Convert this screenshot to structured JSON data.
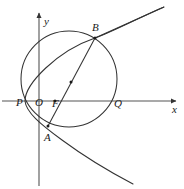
{
  "figure": {
    "title": "",
    "type": "geometry-diagram",
    "background": "#ffffff",
    "stroke_color": "#333333",
    "label_color": "#1a1a1a",
    "width": 184,
    "height": 189
  },
  "axes": {
    "x_label": "x",
    "y_label": "y",
    "origin_label": "O",
    "x_axis": {
      "y": 101,
      "x_start": 2,
      "x_end": 176,
      "arrow": true
    },
    "y_axis": {
      "x": 39,
      "y_start": 13,
      "y_end": 186,
      "arrow": true
    }
  },
  "points": [
    {
      "name": "P",
      "label": "P",
      "x": 25,
      "y": 101,
      "label_dx": -9,
      "label_dy": 2,
      "dot": false
    },
    {
      "name": "O",
      "label": "O",
      "x": 39,
      "y": 101,
      "label_dx": -4,
      "label_dy": 2,
      "dot": false
    },
    {
      "name": "F",
      "label": "F",
      "x": 55,
      "y": 101,
      "label_dx": -3,
      "label_dy": 3,
      "dot": true
    },
    {
      "name": "Q",
      "label": "Q",
      "x": 117,
      "y": 101,
      "label_dx": -3,
      "label_dy": 3,
      "dot": false
    },
    {
      "name": "B",
      "label": "B",
      "x": 95,
      "y": 38,
      "label_dx": -3,
      "label_dy": -10,
      "dot": true
    },
    {
      "name": "A",
      "label": "A",
      "x": 48,
      "y": 126,
      "label_dx": -4,
      "label_dy": 12,
      "dot": true
    },
    {
      "name": "M",
      "label": "",
      "x": 71,
      "y": 82,
      "label_dx": 0,
      "label_dy": 0,
      "dot": true
    }
  ],
  "curves": {
    "circle": {
      "name": "circle",
      "center_x": 69,
      "center_y": 79,
      "radius": 48
    },
    "parabola": {
      "name": "parabola",
      "vertex_x": 25,
      "vertex_y": 101,
      "opens": "right",
      "path": "M 25 101 C 25 84 57 51 95 38 C 117 30 140 17 164 7 M 25 101 C 26 112 40 124 62 140 C 85 157 110 172 133 184"
    },
    "chord": {
      "name": "chord-AB",
      "x1": 48,
      "y1": 126,
      "x2": 95,
      "y2": 38,
      "extend_x": 164,
      "extend_y": 7
    }
  }
}
